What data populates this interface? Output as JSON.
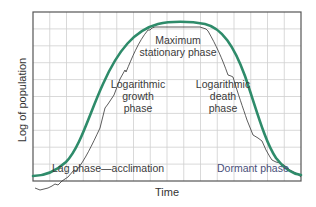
{
  "chart_data": {
    "type": "line",
    "title": "",
    "xlabel": "Time",
    "ylabel": "Log of population",
    "grid": true,
    "legend": null,
    "xlim": [
      0,
      16
    ],
    "ylim": [
      0,
      10
    ],
    "series": [
      {
        "name": "population growth curve",
        "color": "#2e8b6a",
        "x": [
          0,
          1,
          2,
          3,
          4,
          5,
          6,
          7,
          8,
          9,
          10,
          11,
          12,
          13,
          14,
          15,
          16
        ],
        "values": [
          1.2,
          1.5,
          2.1,
          3.4,
          5.5,
          7.6,
          8.9,
          9.5,
          9.6,
          9.4,
          8.6,
          6.9,
          4.7,
          2.9,
          1.9,
          1.4,
          1.2
        ]
      }
    ],
    "annotations": [
      {
        "text": "Maximum stationary phase",
        "span_x": [
          5.7,
          9.7
        ],
        "bracket": "top"
      },
      {
        "text": "Logarithmic growth phase",
        "span_x": [
          2.0,
          5.7
        ]
      },
      {
        "text": "Logarithmic death phase",
        "span_x": [
          9.7,
          12.5
        ]
      },
      {
        "text": "Lag phase—acclimation",
        "span_x": [
          0,
          2.0
        ]
      },
      {
        "text": "Dormant phase",
        "span_x": [
          12.5,
          16
        ]
      }
    ]
  },
  "labels": {
    "ylabel": "Log of population",
    "xlabel": "Time",
    "max_line1": "Maximum",
    "max_line2": "stationary phase",
    "growth_line1": "Logarithmic",
    "growth_line2": "growth",
    "growth_line3": "phase",
    "death_line1": "Logarithmic",
    "death_line2": "death",
    "death_line3": "phase",
    "lag": "Lag phase—acclimation",
    "dormant": "Dormant phase"
  },
  "colors": {
    "curve": "#2e8b6a",
    "grid": "#cfcfcf",
    "frame": "#555555",
    "bracket": "#333333"
  }
}
